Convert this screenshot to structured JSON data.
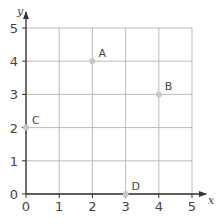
{
  "chart_data": {
    "type": "scatter",
    "title": "",
    "xlabel": "x",
    "ylabel": "y",
    "xlim": [
      0,
      5
    ],
    "ylim": [
      0,
      5
    ],
    "grid": true,
    "x_ticks": [
      "0",
      "1",
      "2",
      "3",
      "4",
      "5"
    ],
    "y_ticks": [
      "0",
      "1",
      "2",
      "3",
      "4",
      "5"
    ],
    "points": [
      {
        "label": "A",
        "x": 2,
        "y": 4
      },
      {
        "label": "B",
        "x": 4,
        "y": 3
      },
      {
        "label": "C",
        "x": 0,
        "y": 2
      },
      {
        "label": "D",
        "x": 3,
        "y": 0
      }
    ],
    "colors": {
      "grid": "#aaaaaa",
      "axis": "#333333",
      "point": "#c8c8c8",
      "text": "#444444"
    }
  }
}
